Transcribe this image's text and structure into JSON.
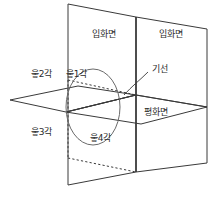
{
  "diagram": {
    "type": "technical-projection-diagram",
    "title": "",
    "stroke_color": "#3a3a3a",
    "background_color": "#ffffff",
    "labels": {
      "vertical_plane_left": "입화면",
      "vertical_plane_right": "입화면",
      "horizontal_plane": "평화면",
      "base_line": "기선",
      "quadrant_1": "읗1각",
      "quadrant_2": "읗2각",
      "quadrant_3": "읗3각",
      "quadrant_4": "읗4각"
    }
  }
}
